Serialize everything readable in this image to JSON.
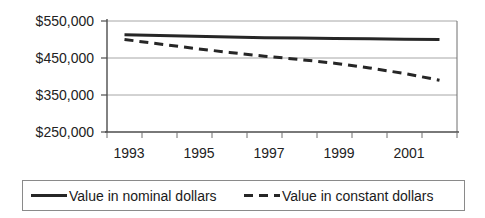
{
  "chart_data": {
    "type": "line",
    "title": "",
    "subtitle": "",
    "xlabel": "",
    "ylabel": "",
    "x": [
      1993,
      1994,
      1995,
      1996,
      1997,
      1998,
      1999,
      2000,
      2001,
      2002
    ],
    "xlim": [
      1992.5,
      2002.5
    ],
    "ylim": [
      250000,
      550000
    ],
    "ytick_values": [
      550000,
      450000,
      350000,
      250000
    ],
    "ytick_labels": [
      "$550,000",
      "$450,000",
      "$350,000",
      "$250,000"
    ],
    "xtick_labels": [
      "1993",
      "1995",
      "1997",
      "1999",
      "2001"
    ],
    "xtick_values": [
      1993,
      1995,
      1997,
      1999,
      2001
    ],
    "grid": true,
    "grid_axis": "y",
    "legend_position": "bottom",
    "series": [
      {
        "name": "Value in nominal dollars",
        "style": "solid",
        "color": "#262626",
        "values": [
          513000,
          511000,
          509000,
          507000,
          505000,
          504000,
          503000,
          502000,
          501000,
          500000
        ]
      },
      {
        "name": "Value in constant dollars",
        "style": "dashed",
        "color": "#262626",
        "values": [
          500000,
          488000,
          476000,
          465000,
          455000,
          446000,
          436000,
          423000,
          408000,
          390000
        ]
      }
    ]
  },
  "legend": {
    "entries": [
      {
        "label": "Value in nominal dollars",
        "style": "solid"
      },
      {
        "label": "Value in constant dollars",
        "style": "dashed"
      }
    ]
  }
}
